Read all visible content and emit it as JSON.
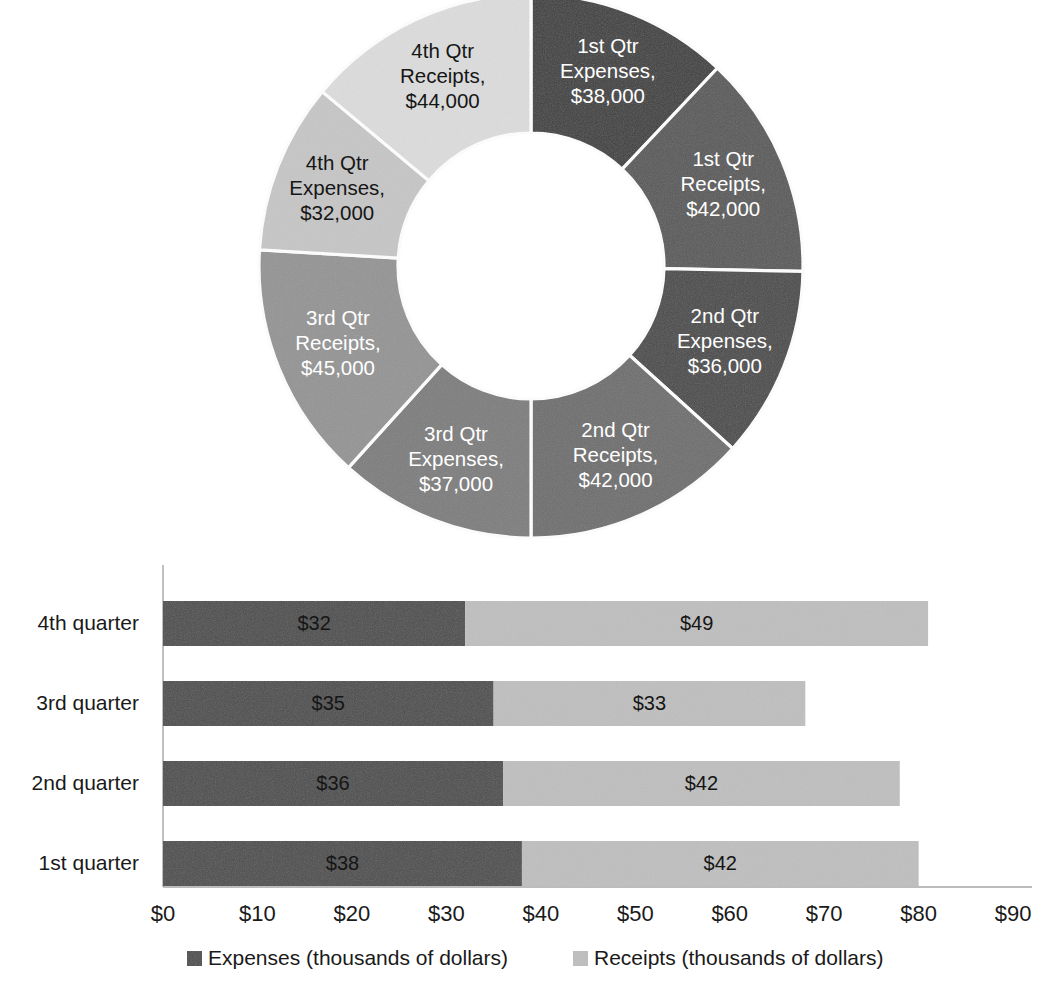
{
  "chart_data": [
    {
      "type": "pie",
      "variant": "doughnut",
      "title": "",
      "slices": [
        {
          "label": "1st Qtr Expenses",
          "value_label": "$38,000",
          "value": 38000,
          "color": "#3f3f3f",
          "text_color": "#ffffff",
          "label_lines": [
            "1st Qtr",
            "Expenses,",
            "$38,000"
          ]
        },
        {
          "label": "1st Qtr Receipts",
          "value_label": "$42,000",
          "value": 42000,
          "color": "#595959",
          "text_color": "#ffffff",
          "label_lines": [
            "1st Qtr",
            "Receipts,",
            "$42,000"
          ]
        },
        {
          "label": "2nd Qtr Expenses",
          "value_label": "$36,000",
          "value": 36000,
          "color": "#4a4a4a",
          "text_color": "#ffffff",
          "label_lines": [
            "2nd Qtr",
            "Expenses,",
            "$36,000"
          ]
        },
        {
          "label": "2nd Qtr Receipts",
          "value_label": "$42,000",
          "value": 42000,
          "color": "#6e6e6e",
          "text_color": "#ffffff",
          "label_lines": [
            "2nd Qtr",
            "Receipts,",
            "$42,000"
          ]
        },
        {
          "label": "3rd Qtr Expenses",
          "value_label": "$37,000",
          "value": 37000,
          "color": "#7d7d7d",
          "text_color": "#ffffff",
          "label_lines": [
            "3rd Qtr",
            "Expenses,",
            "$37,000"
          ]
        },
        {
          "label": "3rd Qtr Receipts",
          "value_label": "$45,000",
          "value": 45000,
          "color": "#949494",
          "text_color": "#ffffff",
          "label_lines": [
            "3rd Qtr",
            "Receipts,",
            "$45,000"
          ]
        },
        {
          "label": "4th Qtr Expenses",
          "value_label": "$32,000",
          "value": 32000,
          "color": "#c6c6c6",
          "text_color": "#161616",
          "label_lines": [
            "4th Qtr",
            "Expenses,",
            "$32,000"
          ]
        },
        {
          "label": "4th Qtr Receipts",
          "value_label": "$44,000",
          "value": 44000,
          "color": "#dcdcdc",
          "text_color": "#161616",
          "label_lines": [
            "4th Qtr",
            "Receipts,",
            "$44,000"
          ]
        }
      ],
      "legend": "none"
    },
    {
      "type": "bar",
      "orientation": "horizontal",
      "stacked": true,
      "title": "",
      "xlabel": "",
      "ylabel": "",
      "categories": [
        "1st quarter",
        "2nd quarter",
        "3rd quarter",
        "4th quarter"
      ],
      "series": [
        {
          "name": "Expenses (thousands of dollars)",
          "color": "#4d4d4d",
          "values": [
            38,
            36,
            35,
            32
          ],
          "value_labels": [
            "$38",
            "$36",
            "$35",
            "$32"
          ],
          "label_color": "#151515"
        },
        {
          "name": "Receipts (thousands of dollars)",
          "color": "#bfbfbf",
          "values": [
            42,
            42,
            33,
            49
          ],
          "value_labels": [
            "$42",
            "$42",
            "$33",
            "$49"
          ],
          "label_color": "#151515"
        }
      ],
      "xlim": [
        0,
        90
      ],
      "xticks": [
        0,
        10,
        20,
        30,
        40,
        50,
        60,
        70,
        80,
        90
      ],
      "xtick_labels": [
        "$0",
        "$10",
        "$20",
        "$30",
        "$40",
        "$50",
        "$60",
        "$70",
        "$80",
        "$90"
      ],
      "grid": false,
      "legend_position": "bottom"
    }
  ]
}
